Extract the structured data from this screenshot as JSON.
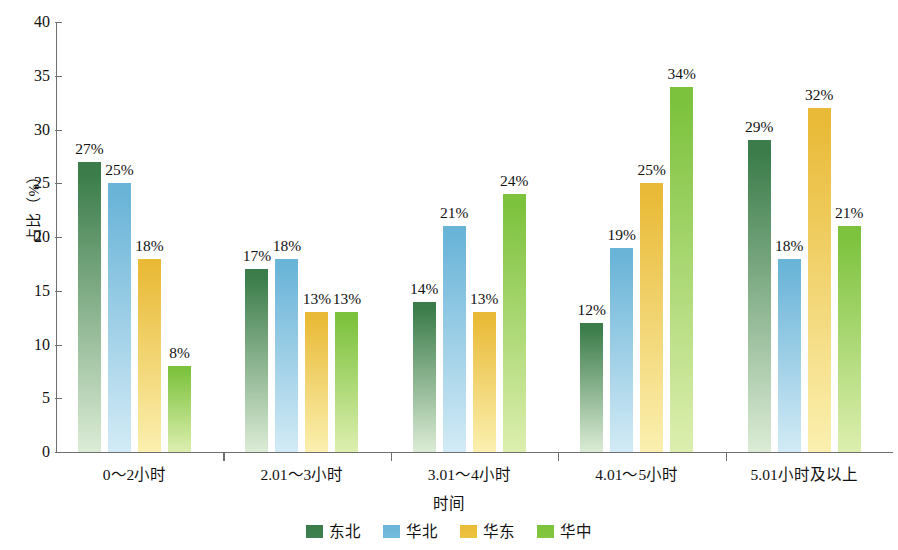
{
  "chart_data": {
    "type": "bar",
    "title": "",
    "subtitle": "",
    "xlabel": "时间",
    "ylabel": "占比（%）",
    "ylim": [
      0,
      40
    ],
    "ytick_labels": [
      "0",
      "5",
      "10",
      "15",
      "20",
      "25",
      "30",
      "35",
      "40"
    ],
    "ytick_values": [
      0,
      5,
      10,
      15,
      20,
      25,
      30,
      35,
      40
    ],
    "grid": false,
    "legend_position": "bottom",
    "value_label_suffix": "%",
    "categories": [
      "0～2小时",
      "2.01～3小时",
      "3.01～4小时",
      "4.01～5小时",
      "5.01小时及以上"
    ],
    "series": [
      {
        "name": "东北",
        "color": "#3f8050",
        "color_top": "#3b7c4a",
        "color_bottom": "#dcecd6",
        "values": [
          27,
          17,
          14,
          12,
          29
        ],
        "labels": [
          "27%",
          "17%",
          "14%",
          "12%",
          "29%"
        ]
      },
      {
        "name": "华北",
        "color": "#74bcdd",
        "color_top": "#6ab4d8",
        "color_bottom": "#d3ebf6",
        "values": [
          25,
          18,
          21,
          19,
          18
        ],
        "labels": [
          "25%",
          "18%",
          "21%",
          "19%",
          "18%"
        ]
      },
      {
        "name": "华东",
        "color": "#ecc33f",
        "color_top": "#e9ba37",
        "color_bottom": "#fbf0b0",
        "values": [
          18,
          13,
          13,
          25,
          32
        ],
        "labels": [
          "18%",
          "13%",
          "13%",
          "25%",
          "32%"
        ]
      },
      {
        "name": "华中",
        "color": "#84c63f",
        "color_top": "#7cc23d",
        "color_bottom": "#ddefaf",
        "values": [
          8,
          13,
          24,
          34,
          21
        ],
        "labels": [
          "8%",
          "13%",
          "24%",
          "34%",
          "21%"
        ]
      }
    ]
  }
}
